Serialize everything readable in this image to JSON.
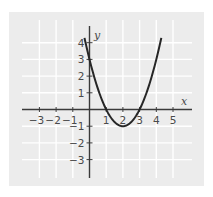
{
  "chart_data": {
    "type": "line",
    "title": "",
    "xlabel": "x",
    "ylabel": "y",
    "xlim": [
      -3.5,
      5.8
    ],
    "ylim": [
      -3.8,
      5
    ],
    "grid": true,
    "x_ticks": [
      -3,
      -2,
      -1,
      1,
      2,
      3,
      4,
      5
    ],
    "x_tick_labels": [
      "−3",
      "−2",
      "−1",
      "1",
      "2",
      "3",
      "4",
      "5"
    ],
    "y_ticks": [
      4,
      3,
      2,
      1,
      -1,
      -2,
      -3
    ],
    "y_tick_labels": [
      "4",
      "3",
      "2",
      "1",
      "−1",
      "−2",
      "−3"
    ],
    "series": [
      {
        "name": "y = x² − 4x + 3",
        "function": "x^2 - 4x + 3",
        "x": [
          -0.27,
          0,
          0.5,
          1,
          1.5,
          2,
          2.5,
          3,
          3.5,
          4,
          4.27
        ],
        "y": [
          4.15,
          3,
          1.25,
          0,
          -0.75,
          -1,
          -0.75,
          0,
          1.25,
          3,
          4.15
        ]
      }
    ],
    "annotations": {
      "roots": [
        1,
        3
      ],
      "vertex": [
        2,
        -1
      ],
      "y_intercept": 3
    }
  },
  "style": {
    "panel_color": "#ececec",
    "grid_color": "#ffffff",
    "axis_color": "#3a3a3a",
    "curve_color": "#262626"
  }
}
